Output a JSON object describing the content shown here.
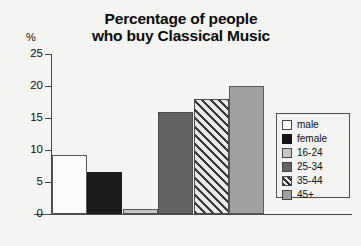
{
  "chart_data": {
    "type": "bar",
    "title": "Percentage of people who buy Classical Music",
    "title_lines": [
      "Percentage of people",
      "who buy Classical Music"
    ],
    "xlabel": "",
    "ylabel": "%",
    "ylim": [
      0,
      25
    ],
    "yticks": [
      0,
      5,
      10,
      15,
      20,
      25
    ],
    "ytick_labels": [
      "0",
      "5",
      "10",
      "15",
      "20",
      "25"
    ],
    "grid": false,
    "legend_position": "right-inside",
    "categories": [
      "male",
      "female",
      "16-24",
      "25-34",
      "35-44",
      "45+"
    ],
    "values": [
      9.2,
      6.5,
      0.8,
      16,
      18,
      20
    ],
    "series": [
      {
        "name": "Percentage of people who buy Classical Music",
        "values": [
          9.2,
          6.5,
          0.8,
          16,
          18,
          20
        ]
      }
    ],
    "bars": [
      {
        "label": "male",
        "value": 9.2,
        "fill": "white"
      },
      {
        "label": "female",
        "value": 6.5,
        "fill": "black"
      },
      {
        "label": "16-24",
        "value": 0.8,
        "fill": "light"
      },
      {
        "label": "25-34",
        "value": 16,
        "fill": "dark"
      },
      {
        "label": "35-44",
        "value": 18,
        "fill": "hatch"
      },
      {
        "label": "45+",
        "value": 20,
        "fill": "mid"
      }
    ]
  },
  "legend": {
    "entries": [
      {
        "label": "male",
        "fill": "white"
      },
      {
        "label": "female",
        "fill": "black"
      },
      {
        "label": "16-24",
        "fill": "light"
      },
      {
        "label": "25-34",
        "fill": "dark"
      },
      {
        "label": "35-44",
        "fill": "hatch"
      },
      {
        "label": "45+",
        "fill": "mid"
      }
    ]
  },
  "colors": {
    "white": "#fbfbfa",
    "black": "#1b1b1b",
    "light": "#c6c6c6",
    "dark": "#636363",
    "hatch": "#e9e9e7",
    "mid": "#a0a0a0",
    "axis": "#4a4a4a",
    "background": "#f4f4f2",
    "text": "#0d0d0d"
  }
}
